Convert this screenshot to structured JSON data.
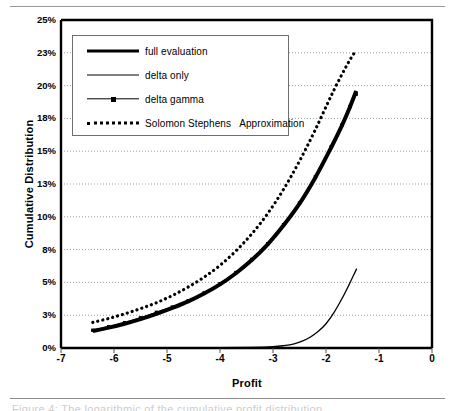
{
  "figure": {
    "caption_ghost": "Figure 4:  The logarithmic of the cumulative profit distribution",
    "x_axis_title": "Profit",
    "y_axis_title": "Cumulative Distribution"
  },
  "legend": {
    "items": [
      {
        "label": "full evaluation",
        "style": "thick-solid",
        "icon": "thick-line-icon"
      },
      {
        "label": "delta only",
        "style": "thin-solid",
        "icon": "thin-line-icon"
      },
      {
        "label": "delta gamma",
        "style": "line-marker",
        "icon": "line-with-square-marker-icon"
      },
      {
        "label": "Solomon Stephens   Approximation",
        "style": "dotted",
        "icon": "dotted-line-icon"
      }
    ]
  },
  "chart_data": {
    "type": "line",
    "title": "",
    "xlabel": "Profit",
    "ylabel": "Cumulative Distribution",
    "xlim": [
      -7,
      0
    ],
    "ylim": [
      0,
      25
    ],
    "xticks": [
      -7,
      -6,
      -5,
      -4,
      -3,
      -2,
      -1,
      0
    ],
    "xtick_labels": [
      "-7",
      "-6",
      "-5",
      "-4",
      "-3",
      "-2",
      "-1",
      "0"
    ],
    "yticks": [
      0,
      2.5,
      5,
      7.5,
      10,
      12.5,
      15,
      17.5,
      20,
      22.5,
      25
    ],
    "ytick_labels": [
      "0%",
      "3%",
      "5%",
      "8%",
      "10%",
      "13%",
      "15%",
      "18%",
      "20%",
      "23%",
      "25%"
    ],
    "grid": "horizontal-dotted",
    "legend_position": "upper-left",
    "series": [
      {
        "name": "full evaluation",
        "style": "thick-solid",
        "color": "#000000",
        "x": [
          -6.4,
          -6.1,
          -5.8,
          -5.5,
          -5.2,
          -4.9,
          -4.6,
          -4.3,
          -4.0,
          -3.7,
          -3.4,
          -3.1,
          -2.8,
          -2.5,
          -2.2,
          -1.9,
          -1.7,
          -1.55,
          -1.43
        ],
        "y": [
          1.3,
          1.55,
          1.85,
          2.2,
          2.6,
          3.05,
          3.55,
          4.15,
          4.85,
          5.7,
          6.7,
          7.9,
          9.35,
          11.0,
          13.0,
          15.3,
          16.95,
          18.35,
          19.6
        ]
      },
      {
        "name": "delta gamma",
        "style": "line-marker",
        "color": "#000000",
        "x": [
          -6.4,
          -6.1,
          -5.8,
          -5.5,
          -5.2,
          -4.9,
          -4.6,
          -4.3,
          -4.0,
          -3.7,
          -3.4,
          -3.1,
          -2.8,
          -2.5,
          -2.2,
          -1.9,
          -1.7,
          -1.55,
          -1.43
        ],
        "y": [
          1.35,
          1.62,
          1.93,
          2.3,
          2.72,
          3.12,
          3.6,
          4.2,
          4.9,
          5.75,
          6.75,
          7.95,
          9.4,
          11.05,
          13.05,
          15.35,
          17.0,
          18.4,
          19.35
        ]
      },
      {
        "name": "delta only",
        "style": "thin-solid",
        "color": "#000000",
        "x": [
          -6.4,
          -5.0,
          -4.0,
          -3.4,
          -3.0,
          -2.8,
          -2.6,
          -2.45,
          -2.3,
          -2.15,
          -2.0,
          -1.85,
          -1.7,
          -1.58,
          -1.48,
          -1.42
        ],
        "y": [
          0.02,
          0.02,
          0.03,
          0.05,
          0.1,
          0.18,
          0.32,
          0.52,
          0.82,
          1.25,
          1.85,
          2.7,
          3.75,
          4.7,
          5.55,
          6.05
        ]
      },
      {
        "name": "Solomon Stephens   Approximation",
        "style": "dotted",
        "color": "#000000",
        "x": [
          -6.4,
          -6.1,
          -5.8,
          -5.5,
          -5.2,
          -4.9,
          -4.6,
          -4.3,
          -4.0,
          -3.7,
          -3.4,
          -3.1,
          -2.8,
          -2.5,
          -2.2,
          -1.9,
          -1.7,
          -1.55,
          -1.43
        ],
        "y": [
          1.95,
          2.25,
          2.6,
          3.0,
          3.45,
          4.0,
          4.65,
          5.4,
          6.3,
          7.4,
          8.7,
          10.25,
          12.1,
          14.25,
          16.65,
          19.25,
          20.85,
          21.95,
          22.7
        ]
      }
    ]
  }
}
